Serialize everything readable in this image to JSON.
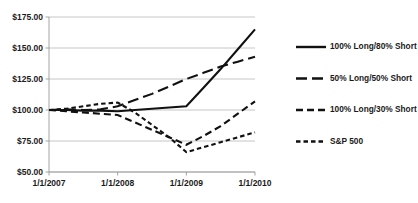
{
  "chart_data": {
    "type": "line",
    "title": "",
    "xlabel": "",
    "ylabel": "",
    "x": [
      "1/1/2007",
      "1/1/2008",
      "1/1/2009",
      "1/1/2010"
    ],
    "xtick_labels": [
      "1/1/2007",
      "1/1/2008",
      "1/1/2009",
      "1/1/2010"
    ],
    "ytick_labels": [
      "$50.00",
      "$75.00",
      "$100.00",
      "$125.00",
      "$150.00",
      "$175.00"
    ],
    "ytick_values": [
      50,
      75,
      100,
      125,
      150,
      175
    ],
    "ylim": [
      50,
      175
    ],
    "grid": true,
    "legend_position": "right",
    "series": [
      {
        "name": "100% Long/80% Short",
        "style": "solid",
        "color": "#111111",
        "x": [
          2007.0,
          2007.25,
          2007.5,
          2007.75,
          2008.0,
          2008.25,
          2008.5,
          2008.75,
          2009.0,
          2009.25,
          2009.5,
          2009.75,
          2010.0
        ],
        "values": [
          100.0,
          100.0,
          99.5,
          99.5,
          99.0,
          100.0,
          101.0,
          102.0,
          103.0,
          118.0,
          133.0,
          149.0,
          165.0
        ]
      },
      {
        "name": "50% Long/50% Short",
        "style": "long-dash",
        "color": "#111111",
        "x": [
          2007.0,
          2007.25,
          2007.5,
          2007.75,
          2008.0,
          2008.25,
          2008.5,
          2008.75,
          2009.0,
          2009.25,
          2009.5,
          2009.75,
          2010.0
        ],
        "values": [
          100.0,
          100.5,
          100.0,
          100.5,
          103.0,
          108.0,
          113.0,
          119.0,
          125.0,
          130.0,
          135.0,
          139.0,
          143.0
        ]
      },
      {
        "name": "100% Long/30% Short",
        "style": "dash",
        "color": "#111111",
        "x": [
          2007.0,
          2007.25,
          2007.5,
          2007.75,
          2008.0,
          2008.25,
          2008.5,
          2008.75,
          2009.0,
          2009.25,
          2009.5,
          2009.75,
          2010.0
        ],
        "values": [
          100.0,
          99.0,
          98.0,
          97.0,
          96.0,
          90.0,
          84.0,
          78.0,
          72.0,
          79.0,
          87.0,
          97.0,
          107.0
        ]
      },
      {
        "name": "S&P 500",
        "style": "short-dash",
        "color": "#111111",
        "x": [
          2007.0,
          2007.25,
          2007.5,
          2007.75,
          2008.0,
          2008.25,
          2008.5,
          2008.75,
          2009.0,
          2009.25,
          2009.5,
          2009.75,
          2010.0
        ],
        "values": [
          100.0,
          101.0,
          103.0,
          105.0,
          106.0,
          98.0,
          88.0,
          78.0,
          66.0,
          70.0,
          74.0,
          78.0,
          82.0
        ]
      }
    ],
    "legend": [
      {
        "label": "100% Long/80% Short",
        "style": "solid"
      },
      {
        "label": "50% Long/50% Short",
        "style": "long-dash"
      },
      {
        "label": "100% Long/30% Short",
        "style": "dash"
      },
      {
        "label": "S&P 500",
        "style": "short-dash"
      }
    ]
  },
  "colors": {
    "line": "#111111",
    "grid": "#bfbfbf",
    "axis": "#9a9a9a",
    "text": "#1a1a1a",
    "background": "#ffffff"
  }
}
